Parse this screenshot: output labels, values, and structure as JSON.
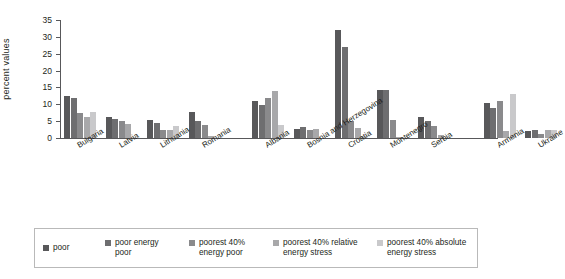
{
  "chart_data": {
    "type": "bar",
    "title": "",
    "xlabel": "",
    "ylabel": "percent values",
    "ylim": [
      0,
      35
    ],
    "yticks": [
      0,
      5,
      10,
      15,
      20,
      25,
      30,
      35
    ],
    "grid": false,
    "legend_position": "bottom",
    "categories": [
      "Bulgaria",
      "Latvia",
      "Lithuania",
      "Romania",
      "Albania",
      "Bosnia and Herzegovina",
      "Croatia",
      "Montenegro",
      "Serbia",
      "Armenia",
      "Ukraine"
    ],
    "series": [
      {
        "name": "poor",
        "color": "#58585a",
        "values": [
          12.4,
          6.3,
          5.2,
          7.7,
          11.0,
          2.6,
          32.0,
          14.2,
          6.2,
          10.5,
          2.0
        ]
      },
      {
        "name": "poor energy poor",
        "color": "#6e6e70",
        "values": [
          12.0,
          5.6,
          4.6,
          4.9,
          9.9,
          3.2,
          27.0,
          14.3,
          4.9,
          8.9,
          2.3
        ]
      },
      {
        "name": "poorest 40% energy poor",
        "color": "#8a8a8c",
        "values": [
          7.4,
          4.9,
          2.3,
          4.0,
          11.8,
          2.3,
          5.1,
          5.2,
          3.5,
          11.0,
          1.1
        ]
      },
      {
        "name": "poorest 40% relative energy stress",
        "color": "#a8a8aa",
        "values": [
          6.1,
          4.1,
          2.4,
          0.7,
          14.0,
          2.8,
          2.9,
          0.2,
          0.9,
          2.0,
          2.4
        ]
      },
      {
        "name": "poorest 40% absolute energy stress",
        "color": "#c9c9cb",
        "values": [
          7.8,
          0.0,
          3.7,
          0.0,
          3.9,
          0.0,
          0.7,
          0.0,
          0.0,
          13.1,
          2.5
        ]
      }
    ]
  },
  "axis": {
    "y_label": "percent values",
    "tick_labels": [
      "0",
      "5",
      "10",
      "15",
      "20",
      "25",
      "30",
      "35"
    ]
  },
  "legend": {
    "items": [
      {
        "label": "poor",
        "color": "#58585a"
      },
      {
        "label": "poor energy\npoor",
        "color": "#6e6e70"
      },
      {
        "label": "poorest 40%\nenergy poor",
        "color": "#8a8a8c"
      },
      {
        "label": "poorest 40% relative\nenergy stress",
        "color": "#a8a8aa"
      },
      {
        "label": "poorest 40% absolute\nenergy stress",
        "color": "#c9c9cb"
      }
    ]
  }
}
